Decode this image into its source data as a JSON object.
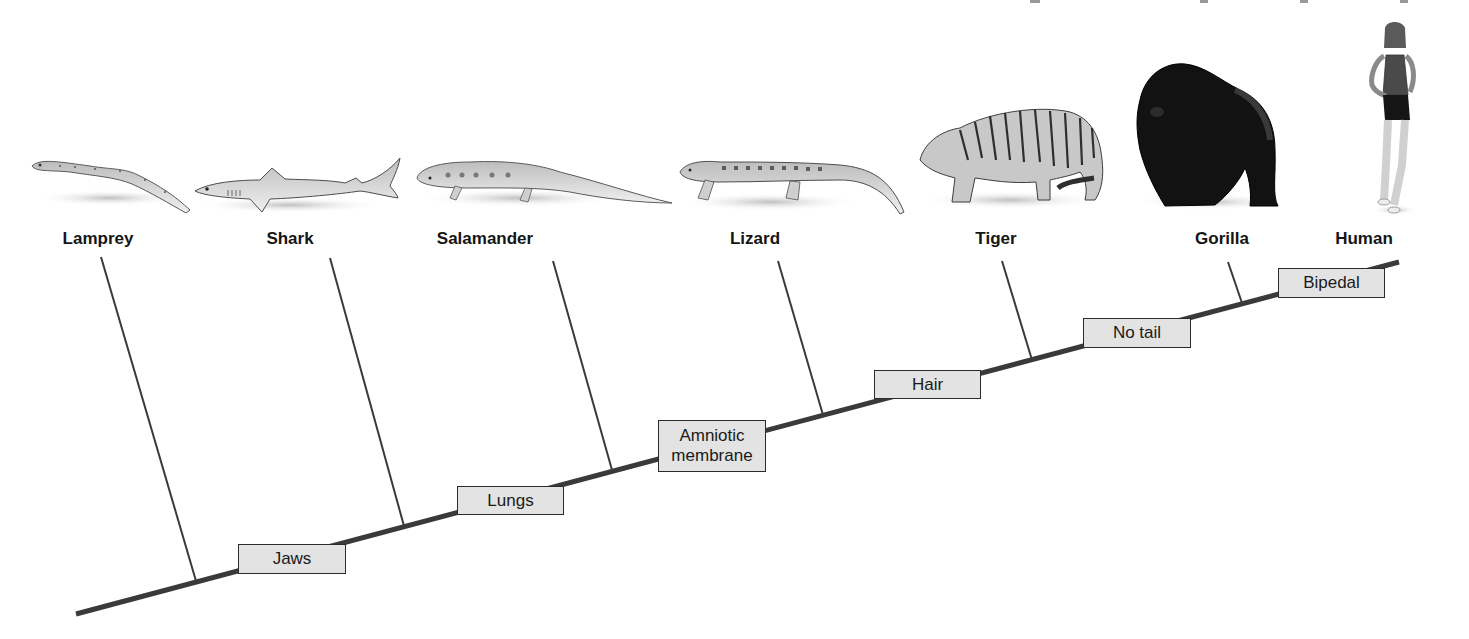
{
  "diagram": {
    "type": "cladogram",
    "colors": {
      "background": "#ffffff",
      "line": "#3a3a3a",
      "box_fill": "#e3e3e3",
      "box_border": "#2b2b2b",
      "label_text": "#151515"
    },
    "main_line": {
      "x1": 76,
      "y1": 614,
      "x2": 1399,
      "y2": 262
    },
    "taxa": [
      {
        "name": "Lamprey",
        "label_x": 98,
        "label_y": 229,
        "branch": {
          "x1": 101,
          "y1": 257,
          "x2": 196,
          "y2": 581
        },
        "image": {
          "x": 30,
          "y": 158,
          "w": 160,
          "h": 55
        }
      },
      {
        "name": "Shark",
        "label_x": 290,
        "label_y": 229,
        "branch": {
          "x1": 330,
          "y1": 258,
          "x2": 404,
          "y2": 526
        },
        "image": {
          "x": 193,
          "y": 157,
          "w": 209,
          "h": 57
        }
      },
      {
        "name": "Salamander",
        "label_x": 485,
        "label_y": 229,
        "branch": {
          "x1": 553,
          "y1": 261,
          "x2": 612,
          "y2": 470
        },
        "image": {
          "x": 415,
          "y": 160,
          "w": 257,
          "h": 47
        }
      },
      {
        "name": "Lizard",
        "label_x": 755,
        "label_y": 229,
        "branch": {
          "x1": 778,
          "y1": 261,
          "x2": 823,
          "y2": 415
        },
        "image": {
          "x": 678,
          "y": 158,
          "w": 227,
          "h": 57
        }
      },
      {
        "name": "Tiger",
        "label_x": 996,
        "label_y": 229,
        "branch": {
          "x1": 1002,
          "y1": 261,
          "x2": 1032,
          "y2": 360
        },
        "image": {
          "x": 915,
          "y": 103,
          "w": 190,
          "h": 105
        }
      },
      {
        "name": "Gorilla",
        "label_x": 1222,
        "label_y": 229,
        "branch": {
          "x1": 1228,
          "y1": 262,
          "x2": 1242,
          "y2": 303
        },
        "image": {
          "x": 1135,
          "y": 62,
          "w": 145,
          "h": 146
        }
      },
      {
        "name": "Human",
        "label_x": 1364,
        "label_y": 229,
        "branch": null,
        "image": {
          "x": 1365,
          "y": 25,
          "w": 60,
          "h": 190
        }
      }
    ],
    "traits": [
      {
        "label": "Jaws",
        "x": 238,
        "y": 544,
        "w": 108,
        "h": 30
      },
      {
        "label": "Lungs",
        "x": 457,
        "y": 486,
        "w": 107,
        "h": 29
      },
      {
        "label": "Amniotic\nmembrane",
        "x": 658,
        "y": 420,
        "w": 108,
        "h": 52
      },
      {
        "label": "Hair",
        "x": 874,
        "y": 370,
        "w": 107,
        "h": 29
      },
      {
        "label": "No tail",
        "x": 1083,
        "y": 318,
        "w": 108,
        "h": 30
      },
      {
        "label": "Bipedal",
        "x": 1278,
        "y": 268,
        "w": 107,
        "h": 30
      }
    ]
  }
}
